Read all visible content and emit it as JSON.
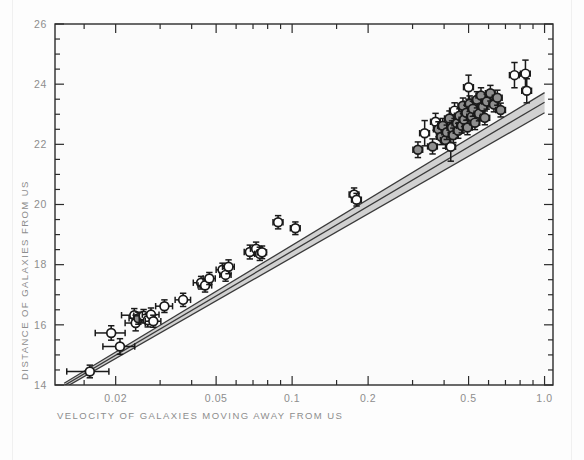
{
  "figure": {
    "background_color": "#fdfdfd",
    "plot_background_color": "#fbfbfb",
    "frame_color": "#2b2b2b",
    "tick_label_color": "#8d8d8d",
    "axis_title_color": "#8d8d8d",
    "point_open_color": "#ffffff",
    "point_filled_color": "#8f8f8f",
    "point_edge_color": "#1a1a1a",
    "errorbar_color": "#1a1a1a",
    "fit_line_color": "#3a3a3a",
    "fit_band_color": "#c9c9c9"
  },
  "chart_data": {
    "type": "scatter",
    "title": "",
    "subtitle": "",
    "xlabel": "VELOCITY OF GALAXIES MOVING AWAY FROM US",
    "ylabel": "DISTANCE OF GALAXIES FROM US",
    "xscale": "log",
    "yscale": "linear",
    "xlim": [
      0.0115,
      1.08
    ],
    "ylim": [
      14,
      26
    ],
    "grid": false,
    "legend": null,
    "xticks": [
      0.02,
      0.05,
      0.1,
      0.2,
      0.5,
      1.0
    ],
    "xticklabels": [
      "0.02",
      "0.05",
      "0.1",
      "0.2",
      "0.5",
      "1.0"
    ],
    "xminorticks": [
      0.015,
      0.03,
      0.04,
      0.06,
      0.07,
      0.08,
      0.09,
      0.15,
      0.3,
      0.4,
      0.6,
      0.7,
      0.8,
      0.9
    ],
    "yticks": [
      14,
      16,
      18,
      20,
      22,
      24,
      26
    ],
    "yticklabels": [
      "14",
      "16",
      "18",
      "20",
      "22",
      "24",
      "26"
    ],
    "yminorticks": [
      14.5,
      15,
      15.5,
      16.5,
      17,
      17.5,
      18.5,
      19,
      19.5,
      20.5,
      21,
      21.5,
      22.5,
      23,
      23.5,
      24.5,
      25,
      25.5
    ],
    "point_style": {
      "marker": "circle",
      "radius_px": 4.4,
      "has_x_error": true,
      "has_y_error": true
    },
    "fit_lines": [
      {
        "name": "upper-fit",
        "x0": 0.0125,
        "y0": 14.06,
        "x1": 1.0,
        "y1": 23.72
      },
      {
        "name": "center-fit",
        "x0": 0.0125,
        "y0": 13.98,
        "x1": 1.0,
        "y1": 23.4
      },
      {
        "name": "lower-fit",
        "x0": 0.0125,
        "y0": 13.9,
        "x1": 1.0,
        "y1": 23.05
      }
    ],
    "points": [
      {
        "x": 0.0158,
        "y": 14.45,
        "xerr": 0.003,
        "yerr": 0.21,
        "fill": "open"
      },
      {
        "x": 0.0192,
        "y": 15.73,
        "xerr": 0.0026,
        "yerr": 0.24,
        "fill": "open"
      },
      {
        "x": 0.0208,
        "y": 15.28,
        "xerr": 0.003,
        "yerr": 0.26,
        "fill": "open"
      },
      {
        "x": 0.0237,
        "y": 16.32,
        "xerr": 0.0026,
        "yerr": 0.22,
        "fill": "open"
      },
      {
        "x": 0.024,
        "y": 16.06,
        "xerr": 0.0022,
        "yerr": 0.26,
        "fill": "open"
      },
      {
        "x": 0.0246,
        "y": 16.22,
        "xerr": 0.002,
        "yerr": 0.2,
        "fill": "filled"
      },
      {
        "x": 0.0258,
        "y": 16.3,
        "xerr": 0.0022,
        "yerr": 0.21,
        "fill": "open"
      },
      {
        "x": 0.0268,
        "y": 16.15,
        "xerr": 0.002,
        "yerr": 0.22,
        "fill": "open"
      },
      {
        "x": 0.0276,
        "y": 16.34,
        "xerr": 0.0021,
        "yerr": 0.22,
        "fill": "open"
      },
      {
        "x": 0.0282,
        "y": 16.12,
        "xerr": 0.002,
        "yerr": 0.2,
        "fill": "open"
      },
      {
        "x": 0.0312,
        "y": 16.62,
        "xerr": 0.0024,
        "yerr": 0.21,
        "fill": "open"
      },
      {
        "x": 0.037,
        "y": 16.83,
        "xerr": 0.0026,
        "yerr": 0.22,
        "fill": "open"
      },
      {
        "x": 0.0436,
        "y": 17.4,
        "xerr": 0.003,
        "yerr": 0.21,
        "fill": "open"
      },
      {
        "x": 0.0452,
        "y": 17.31,
        "xerr": 0.0028,
        "yerr": 0.22,
        "fill": "open"
      },
      {
        "x": 0.047,
        "y": 17.54,
        "xerr": 0.0026,
        "yerr": 0.2,
        "fill": "open"
      },
      {
        "x": 0.053,
        "y": 17.83,
        "xerr": 0.003,
        "yerr": 0.22,
        "fill": "open"
      },
      {
        "x": 0.0545,
        "y": 17.66,
        "xerr": 0.0028,
        "yerr": 0.21,
        "fill": "open"
      },
      {
        "x": 0.056,
        "y": 17.93,
        "xerr": 0.003,
        "yerr": 0.23,
        "fill": "open"
      },
      {
        "x": 0.068,
        "y": 18.42,
        "xerr": 0.0034,
        "yerr": 0.23,
        "fill": "open"
      },
      {
        "x": 0.072,
        "y": 18.53,
        "xerr": 0.0036,
        "yerr": 0.22,
        "fill": "open"
      },
      {
        "x": 0.0745,
        "y": 18.36,
        "xerr": 0.0034,
        "yerr": 0.22,
        "fill": "open"
      },
      {
        "x": 0.076,
        "y": 18.41,
        "xerr": 0.0032,
        "yerr": 0.21,
        "fill": "open"
      },
      {
        "x": 0.088,
        "y": 19.41,
        "xerr": 0.004,
        "yerr": 0.22,
        "fill": "open"
      },
      {
        "x": 0.103,
        "y": 19.21,
        "xerr": 0.0046,
        "yerr": 0.21,
        "fill": "open"
      },
      {
        "x": 0.176,
        "y": 20.33,
        "xerr": 0.0078,
        "yerr": 0.22,
        "fill": "open"
      },
      {
        "x": 0.18,
        "y": 20.16,
        "xerr": 0.008,
        "yerr": 0.21,
        "fill": "open"
      },
      {
        "x": 0.315,
        "y": 21.82,
        "xerr": 0.014,
        "yerr": 0.26,
        "fill": "filled"
      },
      {
        "x": 0.335,
        "y": 22.37,
        "xerr": 0.015,
        "yerr": 0.42,
        "fill": "open"
      },
      {
        "x": 0.36,
        "y": 21.93,
        "xerr": 0.016,
        "yerr": 0.25,
        "fill": "filled"
      },
      {
        "x": 0.37,
        "y": 22.75,
        "xerr": 0.0165,
        "yerr": 0.28,
        "fill": "open"
      },
      {
        "x": 0.38,
        "y": 22.5,
        "xerr": 0.017,
        "yerr": 0.25,
        "fill": "filled"
      },
      {
        "x": 0.39,
        "y": 22.25,
        "xerr": 0.017,
        "yerr": 0.26,
        "fill": "filled"
      },
      {
        "x": 0.395,
        "y": 22.62,
        "xerr": 0.0175,
        "yerr": 0.24,
        "fill": "filled"
      },
      {
        "x": 0.405,
        "y": 22.14,
        "xerr": 0.018,
        "yerr": 0.27,
        "fill": "filled"
      },
      {
        "x": 0.41,
        "y": 22.4,
        "xerr": 0.018,
        "yerr": 0.24,
        "fill": "filled"
      },
      {
        "x": 0.42,
        "y": 22.86,
        "xerr": 0.0185,
        "yerr": 0.25,
        "fill": "filled"
      },
      {
        "x": 0.425,
        "y": 21.92,
        "xerr": 0.019,
        "yerr": 0.48,
        "fill": "open"
      },
      {
        "x": 0.43,
        "y": 22.55,
        "xerr": 0.019,
        "yerr": 0.23,
        "fill": "filled"
      },
      {
        "x": 0.435,
        "y": 22.3,
        "xerr": 0.0195,
        "yerr": 0.24,
        "fill": "filled"
      },
      {
        "x": 0.44,
        "y": 23.12,
        "xerr": 0.0195,
        "yerr": 0.26,
        "fill": "open"
      },
      {
        "x": 0.45,
        "y": 22.7,
        "xerr": 0.02,
        "yerr": 0.24,
        "fill": "filled"
      },
      {
        "x": 0.455,
        "y": 22.45,
        "xerr": 0.02,
        "yerr": 0.25,
        "fill": "filled"
      },
      {
        "x": 0.46,
        "y": 22.95,
        "xerr": 0.0205,
        "yerr": 0.23,
        "fill": "filled"
      },
      {
        "x": 0.47,
        "y": 22.62,
        "xerr": 0.021,
        "yerr": 0.24,
        "fill": "filled"
      },
      {
        "x": 0.475,
        "y": 23.28,
        "xerr": 0.021,
        "yerr": 0.26,
        "fill": "filled"
      },
      {
        "x": 0.48,
        "y": 22.82,
        "xerr": 0.0215,
        "yerr": 0.23,
        "fill": "filled"
      },
      {
        "x": 0.49,
        "y": 23.05,
        "xerr": 0.022,
        "yerr": 0.25,
        "fill": "filled"
      },
      {
        "x": 0.495,
        "y": 22.56,
        "xerr": 0.022,
        "yerr": 0.24,
        "fill": "filled"
      },
      {
        "x": 0.5,
        "y": 23.9,
        "xerr": 0.0225,
        "yerr": 0.4,
        "fill": "open"
      },
      {
        "x": 0.505,
        "y": 23.35,
        "xerr": 0.0225,
        "yerr": 0.26,
        "fill": "filled"
      },
      {
        "x": 0.515,
        "y": 22.92,
        "xerr": 0.023,
        "yerr": 0.24,
        "fill": "filled"
      },
      {
        "x": 0.52,
        "y": 23.18,
        "xerr": 0.023,
        "yerr": 0.25,
        "fill": "filled"
      },
      {
        "x": 0.53,
        "y": 22.72,
        "xerr": 0.0235,
        "yerr": 0.23,
        "fill": "filled"
      },
      {
        "x": 0.54,
        "y": 23.48,
        "xerr": 0.024,
        "yerr": 0.27,
        "fill": "filled"
      },
      {
        "x": 0.55,
        "y": 23.02,
        "xerr": 0.0245,
        "yerr": 0.24,
        "fill": "filled"
      },
      {
        "x": 0.56,
        "y": 23.62,
        "xerr": 0.025,
        "yerr": 0.26,
        "fill": "filled"
      },
      {
        "x": 0.57,
        "y": 23.25,
        "xerr": 0.0255,
        "yerr": 0.25,
        "fill": "filled"
      },
      {
        "x": 0.58,
        "y": 22.88,
        "xerr": 0.026,
        "yerr": 0.23,
        "fill": "filled"
      },
      {
        "x": 0.59,
        "y": 23.42,
        "xerr": 0.026,
        "yerr": 0.25,
        "fill": "filled"
      },
      {
        "x": 0.61,
        "y": 23.7,
        "xerr": 0.027,
        "yerr": 0.26,
        "fill": "filled"
      },
      {
        "x": 0.63,
        "y": 23.32,
        "xerr": 0.028,
        "yerr": 0.24,
        "fill": "filled"
      },
      {
        "x": 0.65,
        "y": 23.55,
        "xerr": 0.029,
        "yerr": 0.25,
        "fill": "filled"
      },
      {
        "x": 0.67,
        "y": 23.14,
        "xerr": 0.03,
        "yerr": 0.23,
        "fill": "filled"
      },
      {
        "x": 0.76,
        "y": 24.3,
        "xerr": 0.034,
        "yerr": 0.42,
        "fill": "open"
      },
      {
        "x": 0.84,
        "y": 24.35,
        "xerr": 0.0375,
        "yerr": 0.45,
        "fill": "open"
      },
      {
        "x": 0.85,
        "y": 23.78,
        "xerr": 0.038,
        "yerr": 0.4,
        "fill": "open"
      }
    ]
  }
}
